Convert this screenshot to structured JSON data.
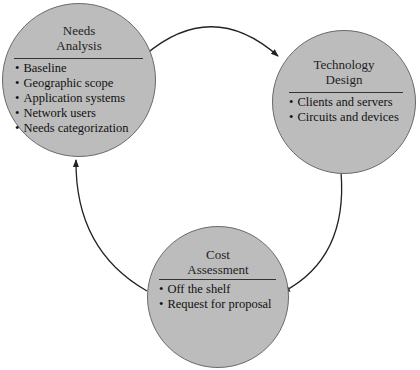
{
  "diagram": {
    "type": "cycle",
    "colors": {
      "node_fill": "#bcbcbc",
      "node_border": "#6a6a6a",
      "arrow": "#222222",
      "text": "#111111"
    },
    "nodes": [
      {
        "id": "needs",
        "title_line1": "Needs",
        "title_line2": "Analysis",
        "items": [
          "Baseline",
          "Geographic scope",
          "Application systems",
          "Network users",
          "Needs categorization"
        ]
      },
      {
        "id": "technology",
        "title_line1": "Technology",
        "title_line2": "Design",
        "items": [
          "Clients and servers",
          "Circuits and devices"
        ]
      },
      {
        "id": "cost",
        "title_line1": "Cost",
        "title_line2": "Assessment",
        "items": [
          "Off the shelf",
          "Request for proposal"
        ]
      }
    ],
    "edges": [
      {
        "from": "needs",
        "to": "technology"
      },
      {
        "from": "technology",
        "to": "cost"
      },
      {
        "from": "cost",
        "to": "needs"
      }
    ]
  }
}
